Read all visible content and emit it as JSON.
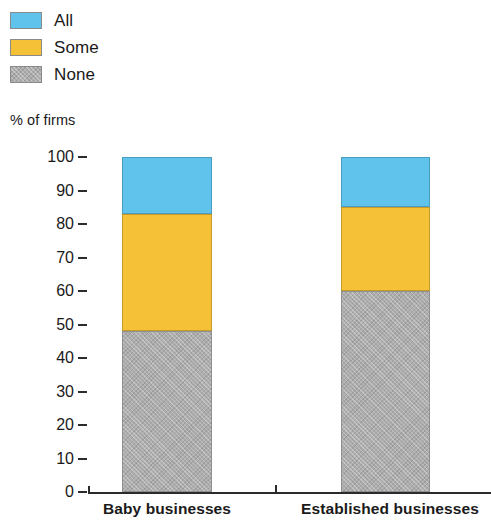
{
  "chart_data": {
    "type": "bar",
    "subtype": "stacked-bar",
    "title": "",
    "subtitle": "",
    "xlabel": "",
    "ylabel": "% of firms",
    "ylim": [
      0,
      100
    ],
    "yticks": [
      100,
      90,
      80,
      70,
      60,
      50,
      40,
      30,
      20,
      10,
      0
    ],
    "ytick_labels": [
      "100",
      "90",
      "80",
      "70",
      "60",
      "50",
      "40",
      "30",
      "20",
      "10",
      "0"
    ],
    "grid": false,
    "legend_position": "top-left",
    "stack_order_bottom_to_top": [
      "None",
      "Some",
      "All"
    ],
    "categories": [
      "Baby businesses",
      "Established businesses"
    ],
    "series": [
      {
        "name": "None",
        "color": "#adadad",
        "values": [
          48,
          60
        ]
      },
      {
        "name": "Some",
        "color": "#f5c136",
        "values": [
          35,
          25
        ]
      },
      {
        "name": "All",
        "color": "#5fc3ec",
        "values": [
          17,
          15
        ]
      }
    ],
    "cumulative_tops": {
      "Baby businesses": {
        "None": 48,
        "Some": 83,
        "All": 100
      },
      "Established businesses": {
        "None": 60,
        "Some": 85,
        "All": 100
      }
    }
  },
  "legend": {
    "items": [
      {
        "label": "All",
        "swatch": "blue"
      },
      {
        "label": "Some",
        "swatch": "yellow"
      },
      {
        "label": "None",
        "swatch": "gray"
      }
    ]
  },
  "axis": {
    "y_title": "% of firms",
    "y_ticks": [
      "100",
      "90",
      "80",
      "70",
      "60",
      "50",
      "40",
      "30",
      "20",
      "10",
      "0"
    ]
  },
  "x_labels": [
    "Baby businesses",
    "Established businesses"
  ],
  "colors": {
    "all": "#5fc3ec",
    "some": "#f5c136",
    "none": "#adadad",
    "axis": "#2b2b2b",
    "text": "#1a1a1a",
    "background": "#ffffff"
  }
}
